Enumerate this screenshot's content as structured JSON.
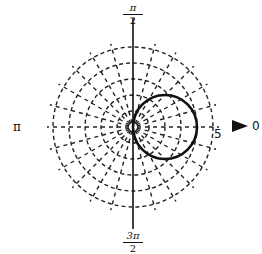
{
  "chart_data": {
    "type": "line",
    "coordinate_system": "polar",
    "title": "",
    "equation": "r = 4 cos θ",
    "series": [
      {
        "name": "r = 4cosθ",
        "shape": "circle",
        "center_polar": [
          2,
          0
        ],
        "radius": 2,
        "max_r": 4
      }
    ],
    "radial_ticks": [
      1,
      2,
      3,
      4,
      5
    ],
    "radial_label_shown": "5",
    "rmax": 5,
    "angular_spoke_step_deg": 15,
    "grid": true,
    "grid_style": "dashed",
    "angle_labels": {
      "0": "0",
      "pi_over_2": {
        "num": "π",
        "den": "2"
      },
      "pi": "π",
      "three_pi_over_2": {
        "num": "3π",
        "den": "2"
      }
    },
    "polar_axis_arrow": true
  },
  "labels": {
    "top_num": "π",
    "top_den": "2",
    "bottom_num": "3π",
    "bottom_den": "2",
    "left": "π",
    "right": "0",
    "radius_tick": "5"
  },
  "colors": {
    "curve": "#111111",
    "grid": "#222222",
    "axis": "#111111"
  }
}
